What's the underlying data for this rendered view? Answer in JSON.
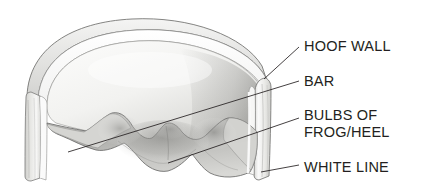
{
  "figure": {
    "background_color": "#ffffff",
    "ink_color": "#231f20",
    "labels": [
      {
        "id": "hoof-wall",
        "text": "HOOF WALL",
        "lines": [
          "HOOF WALL"
        ]
      },
      {
        "id": "bar",
        "text": "BAR",
        "lines": [
          "BAR"
        ]
      },
      {
        "id": "bulbs",
        "text": "BULBS OF FROG/HEEL",
        "lines": [
          "BULBS OF",
          "FROG/HEEL"
        ]
      },
      {
        "id": "white-line",
        "text": "WHITE LINE",
        "lines": [
          "WHITE LINE"
        ]
      }
    ],
    "leader_lines": [
      {
        "id": "leader-hoof-wall",
        "from": [
          299,
          47
        ],
        "to": [
          264,
          79
        ]
      },
      {
        "id": "leader-bar",
        "from": [
          299,
          81
        ],
        "to": [
          68,
          152
        ]
      },
      {
        "id": "leader-bulbs",
        "from": [
          299,
          118
        ],
        "to": [
          168,
          163
        ]
      },
      {
        "id": "leader-white-line",
        "from": [
          299,
          165
        ],
        "to": [
          261,
          172
        ]
      }
    ],
    "illustration": {
      "name": "hoof-sketch",
      "medium": "pencil-graphite-shading",
      "parts": [
        "hoof-wall-rim",
        "hoof-wall-left-band",
        "hoof-wall-right-band",
        "sole",
        "bars",
        "frog",
        "heel-bulbs",
        "white-line"
      ]
    }
  }
}
